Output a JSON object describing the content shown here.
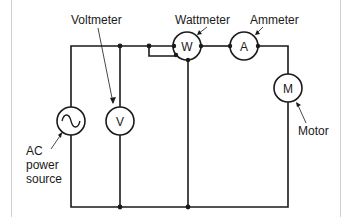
{
  "diagram": {
    "type": "circuit-schematic",
    "labels": {
      "voltmeter": "Voltmeter",
      "wattmeter": "Wattmeter",
      "ammeter": "Ammeter",
      "motor": "Motor",
      "ac_line1": "AC",
      "ac_line2": "power",
      "ac_line3": "source"
    },
    "symbols": {
      "wattmeter": "W",
      "ammeter": "A",
      "motor": "M",
      "voltmeter": "V",
      "ac_source": "~"
    },
    "colors": {
      "line": "#1a1a1a",
      "frame": "#cfcfcf",
      "background": "#ffffff"
    }
  }
}
